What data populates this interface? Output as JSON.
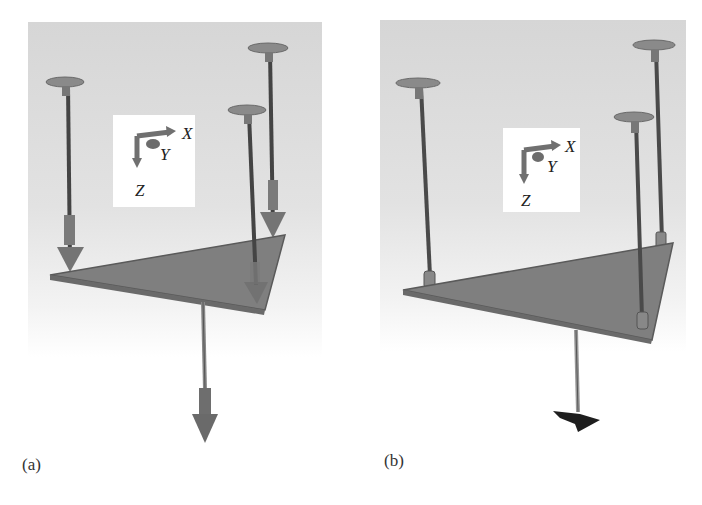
{
  "figure": {
    "panels": [
      {
        "id": "a",
        "caption": "(a)",
        "axes": {
          "x_label": "X",
          "y_label": "Y",
          "z_label": "Z"
        },
        "description": "Triangular platform suspended by three cables from disk anchors, with force arrows pointing down (+Z) on cables and a downward load arrow below the platform"
      },
      {
        "id": "b",
        "caption": "(b)",
        "axes": {
          "x_label": "X",
          "y_label": "Y",
          "z_label": "Z"
        },
        "description": "Same triangular platform suspended by three cables with joints at attachment points and a rod with a dark brush-like end effector below"
      }
    ],
    "colors": {
      "background_gray": "#d9d9d9",
      "platform": "#7d7d7d",
      "platform_edge": "#5a5a5a",
      "cable": "#4a4a4a",
      "disk": "#8a8a8a",
      "arrow": "#707070",
      "brush": "#1e1e1e",
      "inset_bg": "#ffffff"
    }
  }
}
